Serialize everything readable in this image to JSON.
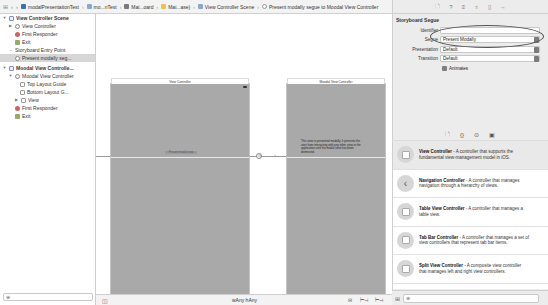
{
  "breadcrumb": {
    "nav_icon": "⊞",
    "back": "‹",
    "forward": "›",
    "items": [
      {
        "label": "modalPresentationTest",
        "icon": "project-icon",
        "color": "#3b6fb6"
      },
      {
        "label": "mo...nTest",
        "icon": "folder-icon",
        "color": "#8da7c9"
      },
      {
        "label": "Mai...oard",
        "icon": "storyboard-icon",
        "color": "#7a7a7a"
      },
      {
        "label": "Mai...ase)",
        "icon": "file-icon",
        "color": "#e8c35a"
      },
      {
        "label": "View Controller Scene",
        "icon": "scene-icon",
        "color": "#8da7c9"
      },
      {
        "label": "Present modally segue to Moodal View Controller",
        "icon": "segue-icon",
        "color": "#999999"
      }
    ],
    "separator": "›"
  },
  "outline": {
    "items": [
      {
        "label": "View Controller Scene",
        "level": 0,
        "bold": true,
        "tri": "▼",
        "icon": "scene"
      },
      {
        "label": "View Controller",
        "level": 1,
        "tri": "▶",
        "icon": "circle"
      },
      {
        "label": "First Responder",
        "level": 1,
        "tri": "",
        "icon": "resp"
      },
      {
        "label": "Exit",
        "level": 1,
        "tri": "",
        "icon": "exit"
      },
      {
        "label": "Storyboard Entry Point",
        "level": 1,
        "tri": "→",
        "icon": "none"
      },
      {
        "label": "Present modally seg...",
        "level": 1,
        "tri": "",
        "icon": "circle",
        "selected": true
      },
      {
        "label": "Moodal View Controlle...",
        "level": 0,
        "bold": true,
        "tri": "▼",
        "icon": "scene"
      },
      {
        "label": "Moodal View Controller",
        "level": 1,
        "tri": "▼",
        "icon": "circle"
      },
      {
        "label": "Top Layout Guide",
        "level": 2,
        "tri": "",
        "icon": "guide"
      },
      {
        "label": "Bottom Layout G...",
        "level": 2,
        "tri": "",
        "icon": "guide"
      },
      {
        "label": "View",
        "level": 2,
        "tri": "▶",
        "icon": "guide"
      },
      {
        "label": "First Responder",
        "level": 1,
        "tri": "",
        "icon": "resp"
      },
      {
        "label": "Exit",
        "level": 1,
        "tri": "",
        "icon": "exit"
      }
    ],
    "filter_icon": "⊕"
  },
  "canvas": {
    "vc1": {
      "title": "View Controller",
      "button": "Present modal view"
    },
    "vc2": {
      "title": "Moodal View Controller",
      "text": "This view is presented modally. It prevents the user from interacting with any other view in the application until the modal view has been dismissed."
    },
    "segue_glyph": "⊙"
  },
  "bottombar": {
    "outline_toggle": "◫",
    "size_class": "wAny hAny",
    "icons": [
      "⊟",
      "⊢⊣",
      "⊢⊣"
    ]
  },
  "inspector": {
    "tab_icons": [
      "🗋",
      "?",
      "≡",
      "♆",
      "▯",
      "→"
    ],
    "title": "Storyboard Segue",
    "fields": [
      {
        "label": "Identifier",
        "value": ""
      },
      {
        "label": "Segue",
        "value": "Present Modally",
        "stepper": true
      },
      {
        "label": "Presentation",
        "value": "Default",
        "stepper": true
      },
      {
        "label": "Transition",
        "value": "Default",
        "stepper": true
      }
    ],
    "animates_label": "Animates",
    "animates_checked": true
  },
  "library": {
    "tab_icons": [
      "🗋",
      "{}",
      "⊙",
      "▣"
    ],
    "items": [
      {
        "name": "View Controller",
        "desc": " - A controller that supports the fundamental view-management model in iOS.",
        "selected": true,
        "icon": "view-controller-icon"
      },
      {
        "name": "Navigation Controller",
        "desc": " - A controller that manages navigation through a hierarchy of views.",
        "icon": "navigation-controller-icon"
      },
      {
        "name": "Table View Controller",
        "desc": " - A controller that manages a table view.",
        "icon": "table-view-controller-icon"
      },
      {
        "name": "Tab Bar Controller",
        "desc": " - A controller that manages a set of view controllers that represent tab bar items.",
        "icon": "tab-bar-controller-icon"
      },
      {
        "name": "Split View Controller",
        "desc": " - A composite view controller that manages left and right view controllers.",
        "icon": "split-view-controller-icon"
      }
    ],
    "grid_icon": "⊞",
    "filter_icon": "⊕"
  }
}
